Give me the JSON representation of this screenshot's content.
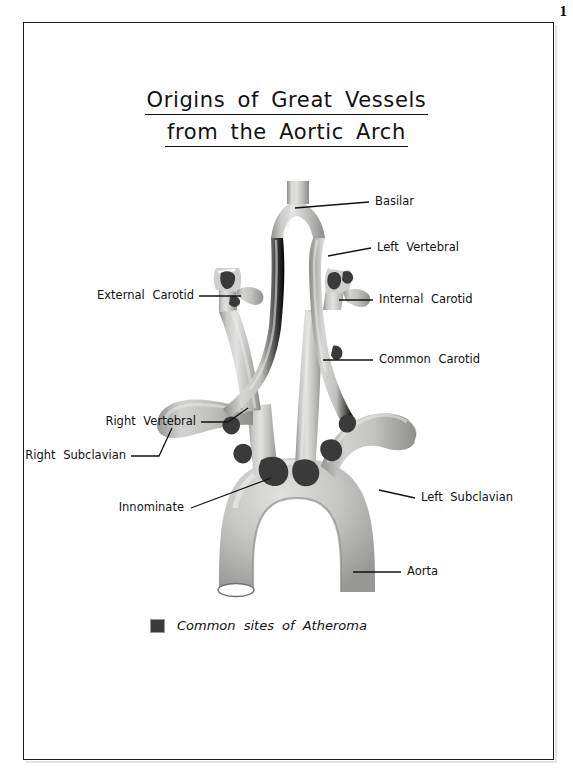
{
  "page": {
    "number": "1"
  },
  "title": {
    "line1": "Origins of Great Vessels",
    "line2": "from the Aortic Arch"
  },
  "legend": {
    "swatch_color": "#3a3a3a",
    "text": "Common sites of Atheroma"
  },
  "colors": {
    "vessel_light": "#d8d8d6",
    "vessel_mid": "#b9b9b7",
    "vessel_dark": "#8e8e8c",
    "vessel_outline": "#6e6e6c",
    "plaque": "#3a3a3a",
    "ink": "#111111",
    "paper": "#ffffff"
  },
  "labels": [
    {
      "id": "basilar",
      "text": "Basilar",
      "side": "right"
    },
    {
      "id": "left-vertebral",
      "text": "Left  Vertebral",
      "side": "right"
    },
    {
      "id": "internal-carotid",
      "text": "Internal  Carotid",
      "side": "right"
    },
    {
      "id": "common-carotid",
      "text": "Common  Carotid",
      "side": "right"
    },
    {
      "id": "left-subclavian",
      "text": "Left  Subclavian",
      "side": "right"
    },
    {
      "id": "aorta",
      "text": "Aorta",
      "side": "right"
    },
    {
      "id": "external-carotid",
      "text": "External  Carotid",
      "side": "left"
    },
    {
      "id": "right-vertebral",
      "text": "Right  Vertebral",
      "side": "left"
    },
    {
      "id": "right-subclavian",
      "text": "Right  Subclavian",
      "side": "left"
    },
    {
      "id": "innominate",
      "text": "Innominate",
      "side": "left"
    }
  ],
  "anatomy": {
    "figure_type": "aortic-arch-great-vessels",
    "plaque_sites": [
      "right internal carotid origin",
      "left internal carotid origin",
      "right vertebral origin",
      "left vertebral origin",
      "innominate origin",
      "left common carotid origin",
      "left subclavian origin"
    ]
  }
}
